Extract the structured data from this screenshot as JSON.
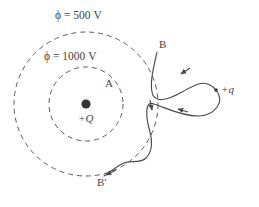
{
  "figure": {
    "type": "physics-field-diagram",
    "background_color": "#ffffff",
    "stroke_color": "#4a4a4a",
    "dash_color": "#5a5a5a",
    "equipotentials": [
      {
        "id": "outer",
        "label": "ϕ = 500 V",
        "voltage": 500,
        "unit": "V",
        "radius_px": 72,
        "style": "dashed"
      },
      {
        "id": "inner",
        "label": "ϕ = 1000 V",
        "voltage": 1000,
        "unit": "V",
        "radius_px": 37,
        "style": "dashed"
      }
    ],
    "charges": [
      {
        "id": "center-charge",
        "label": "+Q",
        "marker": "filled-dot",
        "x": 86,
        "y": 104
      },
      {
        "id": "right-charge",
        "label": "+q",
        "marker": "small-dot",
        "x": 216,
        "y": 90
      }
    ],
    "points": [
      {
        "id": "point-a",
        "label": "A",
        "x": 110,
        "y": 85
      },
      {
        "id": "point-b",
        "label": "B",
        "x": 163,
        "y": 46
      },
      {
        "id": "point-b-prime",
        "label": "B′",
        "x": 104,
        "y": 183
      }
    ],
    "path": {
      "id": "test-charge-path",
      "description": "solid directed path from B around +q loop back to B-prime",
      "arrow_count": 4
    }
  }
}
